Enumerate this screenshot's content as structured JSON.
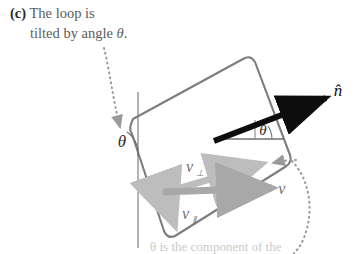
{
  "figure": {
    "part_label": "(c)",
    "caption_line1": "The loop is",
    "caption_line2_prefix": "tilted by angle ",
    "caption_line2_theta": "θ",
    "caption_line2_suffix": ".",
    "bottom_cut_text": "θ is the    component of the"
  },
  "labels": {
    "normal_vector": "n̂",
    "velocity_vector": "v⃗",
    "velocity_perp_base": "v",
    "velocity_perp_sub": "⊥",
    "velocity_parallel_base": "v",
    "velocity_parallel_sub": "∥",
    "angle_left": "θ",
    "angle_right": "θ"
  },
  "colors": {
    "loop_stroke": "#7d7d7d",
    "normal_arrow": "#0d0d0d",
    "velocity_arrow": "#a8a8a8",
    "velocity_perp_arrow": "#bdbdbd",
    "velocity_parallel_arrow": "#bdbdbd",
    "reference_line": "#8a8a8a",
    "dotted_leader": "#9a9a9a",
    "caption_text": "#5b5b5b",
    "background": "#ffffff"
  },
  "geometry": {
    "loop_corners": [
      {
        "name": "top-left",
        "x": 128,
        "y": 124
      },
      {
        "name": "top-right",
        "x": 248,
        "y": 62
      },
      {
        "name": "bottom-right",
        "x": 291,
        "y": 161
      },
      {
        "name": "bottom-left",
        "x": 168,
        "y": 236
      }
    ],
    "normal_arrow": {
      "x1": 215,
      "y1": 140,
      "x2": 330,
      "y2": 96
    },
    "velocity_arrow": {
      "x1": 163,
      "y1": 194,
      "x2": 280,
      "y2": 188
    },
    "velocity_perp_arrow": {
      "x1": 163,
      "y1": 194,
      "x2": 268,
      "y2": 163
    },
    "velocity_parallel_arrow": {
      "x1": 163,
      "y1": 194,
      "x2": 178,
      "y2": 232
    },
    "vertical_reference": {
      "x": 138,
      "y1": 92,
      "y2": 248
    },
    "horizontal_reference": {
      "x1": 218,
      "y1": 139,
      "x2": 282,
      "y2": 139
    }
  }
}
